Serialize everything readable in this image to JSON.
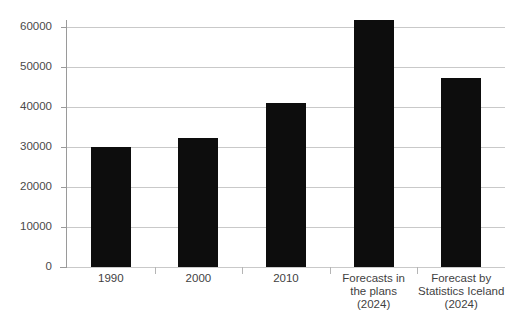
{
  "chart_data": {
    "type": "bar",
    "title": "",
    "xlabel": "",
    "ylabel": "",
    "categories": [
      "1990",
      "2000",
      "2010",
      "Forecasts in\nthe plans\n(2024)",
      "Forecast by\nStatistics Iceland\n(2024)"
    ],
    "values": [
      29900,
      32200,
      41000,
      61800,
      47200
    ],
    "ylim": [
      0,
      65000
    ],
    "yticks": [
      0,
      10000,
      20000,
      30000,
      40000,
      50000,
      60000
    ],
    "ytick_labels": [
      "0",
      "10000",
      "20000",
      "30000",
      "40000",
      "50000",
      "60000"
    ],
    "grid": true,
    "legend": false,
    "bar_color": "#0d0d0d",
    "gridline_color": "#c9c9c9",
    "axis_color": "#9a9a9a",
    "background_color": "#ffffff"
  }
}
